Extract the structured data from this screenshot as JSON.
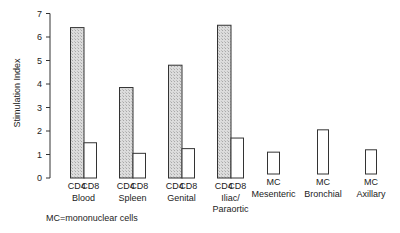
{
  "chart_data": {
    "type": "bar",
    "title": "",
    "xlabel": "",
    "ylabel": "Stimulation Index",
    "ylim": [
      0,
      7
    ],
    "yticks": [
      0,
      1,
      2,
      3,
      4,
      5,
      6,
      7
    ],
    "grid": false,
    "legend": null,
    "groups": [
      {
        "name": "Blood",
        "bars": [
          {
            "label": "CD4",
            "value": 6.4,
            "fill": "hatched"
          },
          {
            "label": "CD8",
            "value": 1.5,
            "fill": "open"
          }
        ]
      },
      {
        "name": "Spleen",
        "bars": [
          {
            "label": "CD4",
            "value": 3.85,
            "fill": "hatched"
          },
          {
            "label": "CD8",
            "value": 1.05,
            "fill": "open"
          }
        ]
      },
      {
        "name": "Genital",
        "bars": [
          {
            "label": "CD4",
            "value": 4.8,
            "fill": "hatched"
          },
          {
            "label": "CD8",
            "value": 1.25,
            "fill": "open"
          }
        ]
      },
      {
        "name": "Iliac/ Paraortic",
        "bars": [
          {
            "label": "CD4",
            "value": 6.5,
            "fill": "hatched"
          },
          {
            "label": "CD8",
            "value": 1.7,
            "fill": "open"
          }
        ]
      },
      {
        "name": "Mesenteric",
        "bars": [
          {
            "label": "MC",
            "value": 1.1,
            "fill": "open"
          }
        ]
      },
      {
        "name": "Bronchial",
        "bars": [
          {
            "label": "MC",
            "value": 2.05,
            "fill": "open"
          }
        ]
      },
      {
        "name": "Axillary",
        "bars": [
          {
            "label": "MC",
            "value": 1.2,
            "fill": "open"
          }
        ]
      }
    ],
    "annotations": [
      "MC=mononuclear cells"
    ]
  },
  "labels": {
    "ylabel": "Stimulation Index",
    "footnote": "MC=mononuclear cells",
    "yticks": [
      "0",
      "1",
      "2",
      "3",
      "4",
      "5",
      "6",
      "7"
    ],
    "groups": [
      {
        "bars": [
          "CD4",
          "CD8"
        ],
        "name_line1": "Blood",
        "name_line2": ""
      },
      {
        "bars": [
          "CD4",
          "CD8"
        ],
        "name_line1": "Spleen",
        "name_line2": ""
      },
      {
        "bars": [
          "CD4",
          "CD8"
        ],
        "name_line1": "Genital",
        "name_line2": ""
      },
      {
        "bars": [
          "CD4",
          "CD8"
        ],
        "name_line1": "Iliac/",
        "name_line2": "Paraortic"
      },
      {
        "bars": [
          "MC"
        ],
        "name_line1": "Mesenteric",
        "name_line2": ""
      },
      {
        "bars": [
          "MC"
        ],
        "name_line1": "Bronchial",
        "name_line2": ""
      },
      {
        "bars": [
          "MC"
        ],
        "name_line1": "Axillary",
        "name_line2": ""
      }
    ]
  },
  "colors": {
    "axis": "#333333",
    "bar_stroke": "#333333",
    "hatched_fill": "#d6d6d6",
    "open_fill": "#ffffff"
  }
}
